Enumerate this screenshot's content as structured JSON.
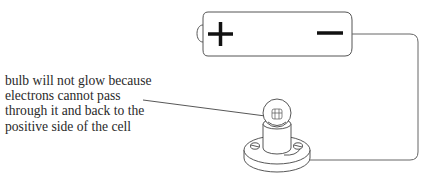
{
  "diagram": {
    "caption_lines": [
      "bulb will not glow because",
      "electrons cannot pass",
      "through it and back to the",
      "positive side of the cell"
    ],
    "battery": {
      "positive_symbol": "+",
      "negative_symbol": "−"
    },
    "colors": {
      "line": "#555555",
      "symbol": "#111111",
      "text": "#2a2a2a"
    }
  }
}
